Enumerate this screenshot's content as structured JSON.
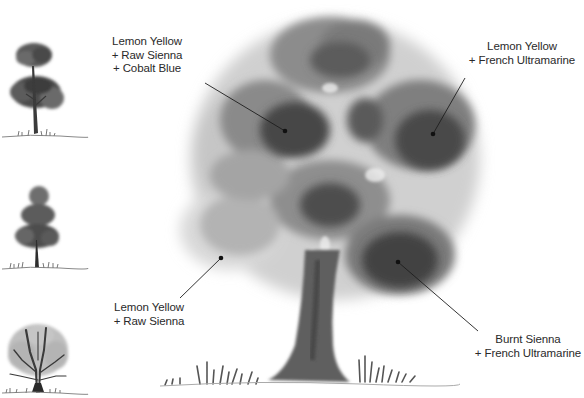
{
  "illustration": {
    "subject": "watercolor tree painting demonstration",
    "palette_note": "grayscale reproduction",
    "colors": {
      "background": "#ffffff",
      "text": "#2a2a2a",
      "leader_line": "#1e1e1e",
      "foliage_dark": "#3a3a3a",
      "foliage_mid": "#6e6e6e",
      "foliage_light": "#b5b5b5",
      "trunk": "#555555"
    }
  },
  "callouts": [
    {
      "id": "top-left",
      "lines": [
        "Lemon Yellow",
        "+ Raw Sienna",
        "+ Cobalt Blue"
      ],
      "line_from": [
        205,
        83
      ],
      "dot": [
        285,
        131
      ]
    },
    {
      "id": "top-right",
      "lines": [
        "Lemon Yellow",
        "+ French Ultramarine"
      ],
      "line_from": [
        465,
        78
      ],
      "dot": [
        433,
        134
      ]
    },
    {
      "id": "bottom-left",
      "lines": [
        "Lemon Yellow",
        "+ Raw Sienna"
      ],
      "line_from": [
        180,
        298
      ],
      "dot": [
        221,
        258
      ]
    },
    {
      "id": "bottom-right",
      "lines": [
        "Burnt Sienna",
        "+ French Ultramarine"
      ],
      "line_from": [
        478,
        331
      ],
      "dot": [
        398,
        262
      ]
    }
  ],
  "small_trees": [
    {
      "id": "tree-study-1",
      "type": "tall two-tier canopy tree"
    },
    {
      "id": "tree-study-2",
      "type": "conical layered tree"
    },
    {
      "id": "tree-study-3",
      "type": "bare spreading branches tree"
    }
  ]
}
